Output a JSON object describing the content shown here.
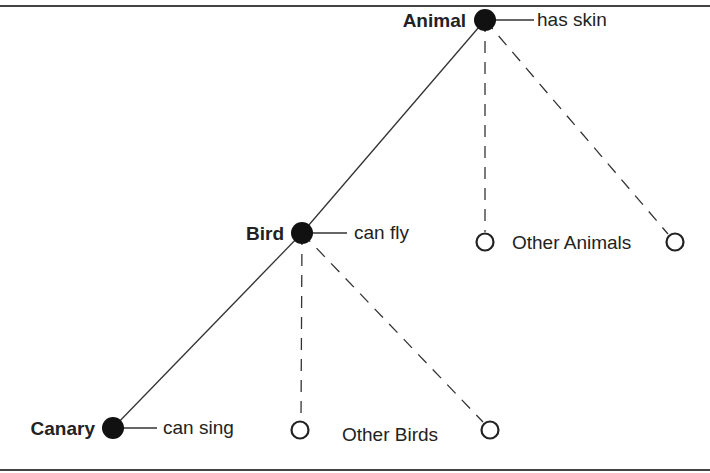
{
  "diagram": {
    "type": "semantic-network-hierarchy",
    "nodes": [
      {
        "id": "animal",
        "label": "Animal",
        "kind": "filled",
        "property": "has skin"
      },
      {
        "id": "bird",
        "label": "Bird",
        "kind": "filled",
        "property": "can fly"
      },
      {
        "id": "canary",
        "label": "Canary",
        "kind": "filled",
        "property": "can sing"
      },
      {
        "id": "other-animals-1",
        "label": "",
        "kind": "open"
      },
      {
        "id": "other-animals-2",
        "label": "",
        "kind": "open"
      },
      {
        "id": "other-birds-1",
        "label": "",
        "kind": "open"
      },
      {
        "id": "other-birds-2",
        "label": "",
        "kind": "open"
      }
    ],
    "group_labels": {
      "other_animals": "Other Animals",
      "other_birds": "Other Birds"
    },
    "edges": [
      {
        "from": "animal",
        "to": "bird",
        "style": "solid"
      },
      {
        "from": "animal",
        "to": "other-animals-1",
        "style": "dashed"
      },
      {
        "from": "animal",
        "to": "other-animals-2",
        "style": "dashed"
      },
      {
        "from": "bird",
        "to": "canary",
        "style": "solid"
      },
      {
        "from": "bird",
        "to": "other-birds-1",
        "style": "dashed"
      },
      {
        "from": "bird",
        "to": "other-birds-2",
        "style": "dashed"
      }
    ]
  }
}
